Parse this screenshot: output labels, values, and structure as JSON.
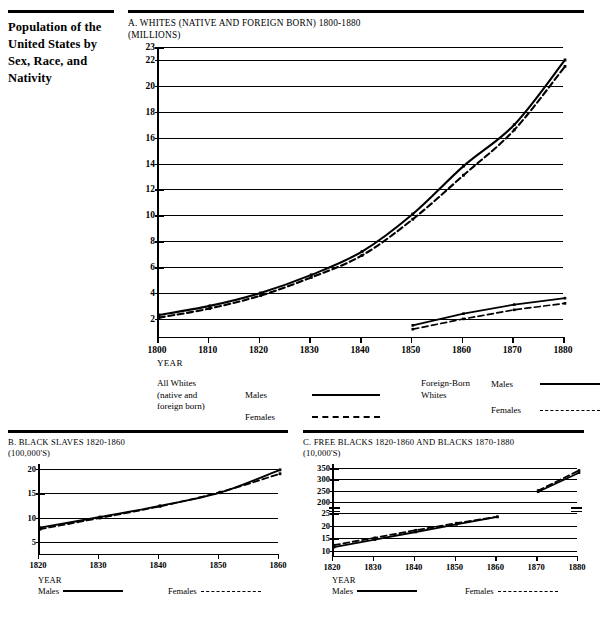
{
  "sidebar": {
    "title": "Population of the United States by Sex, Race, and Nativity"
  },
  "chart_a": {
    "heading_line1": "A.  WHITES (NATIVE AND FOREIGN BORN) 1800-1880",
    "heading_line2": "(MILLIONS)",
    "xlabel": "YEAR",
    "legend": {
      "group1_line1": "All Whites",
      "group1_line2": "(native and",
      "group1_line3": "foreign born)",
      "group1_males": "Males",
      "group1_females": "Females",
      "group2_line1": "Foreign-Born",
      "group2_line2": "Whites",
      "group2_males": "Males",
      "group2_females": "Females"
    }
  },
  "chart_b": {
    "heading_line1": "B.  BLACK SLAVES 1820-1860",
    "heading_line2": "(100,000'S)",
    "xlabel": "YEAR",
    "legend_males": "Males",
    "legend_females": "Females"
  },
  "chart_c": {
    "heading_line1": "C. FREE BLACKS 1820-1860 AND BLACKS 1870-1880",
    "heading_line2": "(10,000'S)",
    "xlabel": "YEAR",
    "legend_males": "Males",
    "legend_females": "Females"
  },
  "chart_data": [
    {
      "id": "A",
      "type": "line",
      "title": "A.  WHITES (NATIVE AND FOREIGN BORN) 1800-1880 (MILLIONS)",
      "xlabel": "YEAR",
      "ylabel": "MILLIONS",
      "x": [
        1800,
        1810,
        1820,
        1830,
        1840,
        1850,
        1860,
        1870,
        1880
      ],
      "xticks": [
        "1800",
        "1810",
        "1820",
        "1830",
        "1840",
        "1850",
        "1860",
        "1870",
        "1880"
      ],
      "yticks": [
        2,
        4,
        6,
        8,
        10,
        12,
        14,
        16,
        18,
        20,
        22,
        23
      ],
      "ylim": [
        0.6,
        23
      ],
      "xlim": [
        1800,
        1880
      ],
      "grid": true,
      "legend_position": "below",
      "series": [
        {
          "name": "All Whites (native and foreign born) Males",
          "style": "solid",
          "x": [
            1800,
            1810,
            1820,
            1830,
            1840,
            1850,
            1860,
            1870,
            1880
          ],
          "values": [
            2.3,
            3.0,
            4.0,
            5.4,
            7.2,
            10.1,
            13.8,
            17.0,
            22.0
          ]
        },
        {
          "name": "All Whites (native and foreign born) Females",
          "style": "dashed",
          "x": [
            1800,
            1810,
            1820,
            1830,
            1840,
            1850,
            1860,
            1870,
            1880
          ],
          "values": [
            2.1,
            2.8,
            3.8,
            5.2,
            6.9,
            9.7,
            13.1,
            16.6,
            21.5
          ]
        },
        {
          "name": "Foreign-Born Whites Males",
          "style": "solid",
          "x": [
            1850,
            1860,
            1870,
            1880
          ],
          "values": [
            1.5,
            2.4,
            3.1,
            3.6
          ]
        },
        {
          "name": "Foreign-Born Whites Females",
          "style": "dashed",
          "x": [
            1850,
            1860,
            1870,
            1880
          ],
          "values": [
            1.2,
            2.0,
            2.7,
            3.2
          ]
        }
      ]
    },
    {
      "id": "B",
      "type": "line",
      "title": "B.  BLACK SLAVES 1820-1860 (100,000'S)",
      "xlabel": "YEAR",
      "ylabel": "100,000'S",
      "xticks": [
        "1820",
        "1830",
        "1840",
        "1850",
        "1860"
      ],
      "yticks": [
        5,
        10,
        15,
        20
      ],
      "ylim": [
        2.5,
        21
      ],
      "xlim": [
        1820,
        1860
      ],
      "grid": true,
      "series": [
        {
          "name": "Males",
          "style": "solid",
          "x": [
            1820,
            1830,
            1840,
            1850,
            1860
          ],
          "values": [
            7.9,
            10.1,
            12.4,
            15.1,
            19.8
          ]
        },
        {
          "name": "Females",
          "style": "dashed",
          "x": [
            1820,
            1830,
            1840,
            1850,
            1860
          ],
          "values": [
            7.6,
            9.9,
            12.3,
            15.2,
            19.0
          ]
        }
      ]
    },
    {
      "id": "C",
      "type": "line",
      "title": "C. FREE BLACKS 1820-1860 AND BLACKS 1870-1880 (10,000'S)",
      "xlabel": "YEAR",
      "ylabel": "10,000'S",
      "xticks": [
        "1820",
        "1830",
        "1840",
        "1850",
        "1860",
        "1870",
        "1880"
      ],
      "yticks_upper": [
        200,
        250,
        300,
        350
      ],
      "yticks_lower": [
        10,
        15,
        20,
        25
      ],
      "axis_break": true,
      "grid": true,
      "series": [
        {
          "name": "Free Blacks Males 1820-1860",
          "style": "solid",
          "x": [
            1820,
            1830,
            1840,
            1850,
            1860
          ],
          "values": [
            11.5,
            14.5,
            17.5,
            20.5,
            23.5
          ]
        },
        {
          "name": "Free Blacks Females 1820-1860",
          "style": "dashed",
          "x": [
            1820,
            1830,
            1840,
            1850,
            1860
          ],
          "values": [
            12.3,
            15.2,
            18.2,
            21.0,
            23.5
          ]
        },
        {
          "name": "Blacks Males 1870-1880",
          "style": "solid",
          "x": [
            1870,
            1880
          ],
          "values": [
            245,
            330
          ]
        },
        {
          "name": "Blacks Females 1870-1880",
          "style": "dashed",
          "x": [
            1870,
            1880
          ],
          "values": [
            250,
            340
          ]
        }
      ]
    }
  ]
}
